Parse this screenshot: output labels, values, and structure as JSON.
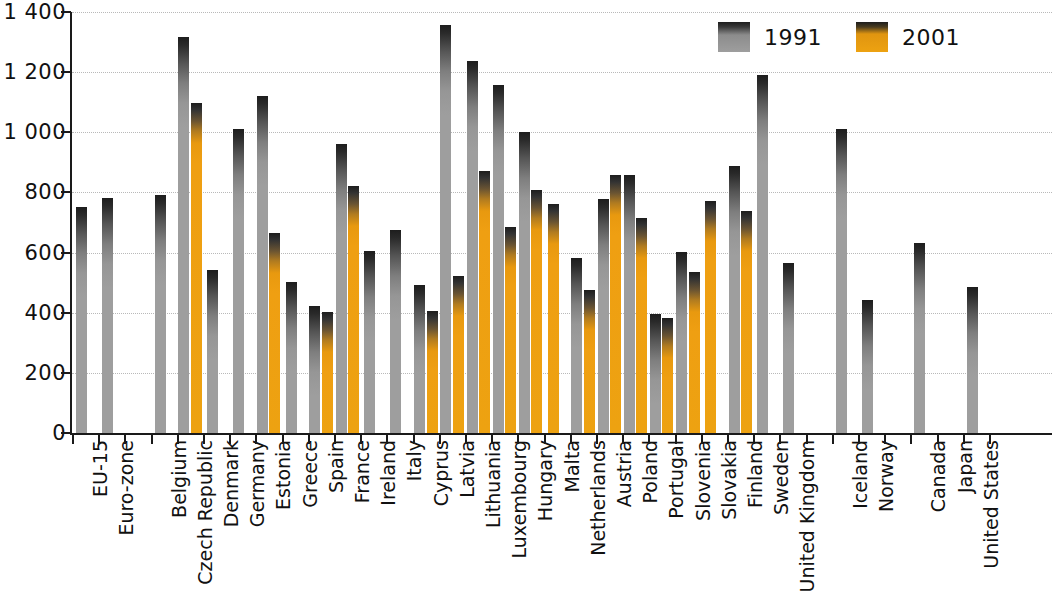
{
  "legend": {
    "position": "top-right",
    "entries": [
      {
        "name": "1991",
        "color": "#9e9e9e"
      },
      {
        "name": "2001",
        "color": "#eda211"
      }
    ]
  },
  "axis": {
    "y_ticks": [
      "0",
      "200",
      "400",
      "600",
      "800",
      "1 000",
      "1 200",
      "1 400"
    ],
    "y_tick_values": [
      0,
      200,
      400,
      600,
      800,
      1000,
      1200,
      1400
    ],
    "y_min": 0,
    "y_max": 1400,
    "grid": true
  },
  "chart_data": {
    "type": "bar",
    "title": "",
    "subtitle": "",
    "xlabel": "",
    "ylabel": "",
    "ylim": [
      0,
      1400
    ],
    "grid": true,
    "legend_position": "top-right",
    "categories": [
      "EU-15",
      "Euro-zone",
      "",
      "Belgium",
      "Czech Republic",
      "Denmark",
      "Germany",
      "Estonia",
      "Greece",
      "Spain",
      "France",
      "Ireland",
      "Italy",
      "Cyprus",
      "Latvia",
      "Lithuania",
      "Luxembourg",
      "Hungary",
      "Malta",
      "Netherlands",
      "Austria",
      "Poland",
      "Portugal",
      "Slovenia",
      "Slovakia",
      "Finland",
      "Sweden",
      "United Kingdom",
      "",
      "Iceland",
      "Norway",
      "",
      "Canada",
      "Japan",
      "United States"
    ],
    "series": [
      {
        "name": "1991",
        "color": "#9e9e9e",
        "values": [
          755,
          785,
          null,
          795,
          1320,
          545,
          1015,
          1125,
          505,
          425,
          965,
          610,
          680,
          495,
          1360,
          1240,
          1160,
          1005,
          null,
          585,
          780,
          860,
          400,
          605,
          null,
          890,
          1195,
          570,
          null,
          1015,
          445,
          null,
          635,
          null,
          490
        ]
      },
      {
        "name": "2001",
        "color": "#eda211",
        "values": [
          null,
          null,
          null,
          null,
          1100,
          null,
          null,
          670,
          null,
          405,
          825,
          null,
          null,
          410,
          525,
          875,
          690,
          810,
          765,
          480,
          860,
          720,
          385,
          540,
          775,
          740,
          null,
          null,
          null,
          null,
          null,
          null,
          null,
          null,
          null
        ]
      }
    ]
  }
}
